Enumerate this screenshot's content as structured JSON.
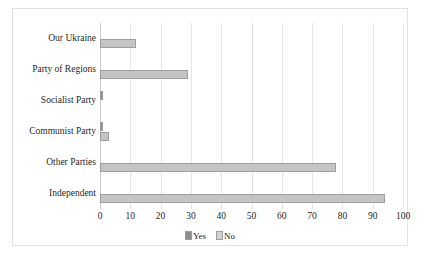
{
  "chart_data": {
    "type": "bar",
    "orientation": "horizontal",
    "title": "",
    "xlabel": "",
    "ylabel": "",
    "categories": [
      "Our Ukraine",
      "Party of Regions",
      "Socialist Party",
      "Communist Party",
      "Other Parties",
      "Independent"
    ],
    "series": [
      {
        "name": "Yes",
        "color": "#8d8d8d",
        "values": [
          0,
          0,
          1,
          1,
          0,
          0
        ]
      },
      {
        "name": "No",
        "color": "#c4c4c4",
        "values": [
          12,
          29,
          0,
          3,
          78,
          94
        ]
      }
    ],
    "xlim": [
      0,
      100
    ],
    "xticks": [
      "0",
      "10",
      "20",
      "30",
      "40",
      "50",
      "60",
      "70",
      "80",
      "90",
      "100"
    ],
    "grid": true,
    "legend_position": "bottom",
    "legend": [
      "Yes",
      "No"
    ]
  }
}
